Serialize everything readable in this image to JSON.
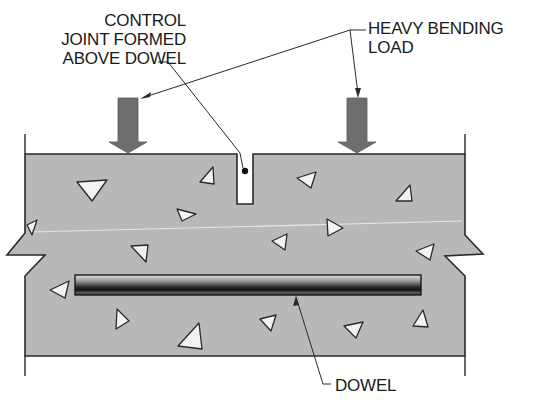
{
  "diagram": {
    "type": "cross-section",
    "colors": {
      "concrete": "#b8b8b8",
      "outline": "#2a2a2a",
      "arrow": "#6e6e6e",
      "aggregate": "#f2f2f2",
      "dowel_dark": "#1c1c1c",
      "dowel_light": "#d8d8d8",
      "text": "#1a1a1a"
    }
  },
  "labels": {
    "control_joint": {
      "lines": [
        "CONTROL",
        "JOINT FORMED",
        "ABOVE DOWEL"
      ]
    },
    "load": {
      "lines": [
        "HEAVY BENDING",
        "LOAD"
      ]
    },
    "dowel": {
      "lines": [
        "DOWEL"
      ]
    }
  },
  "elements": {
    "slab": {
      "x": 25,
      "y": 154,
      "width": 440,
      "height": 202
    },
    "joint_notch": {
      "x": 237,
      "y": 154,
      "width": 16,
      "height": 50
    },
    "dowel_bar": {
      "x": 75,
      "y": 275,
      "width": 346,
      "height": 20
    },
    "load_arrows": [
      {
        "name": "left-load-arrow",
        "x": 128
      },
      {
        "name": "right-load-arrow",
        "x": 357
      }
    ]
  }
}
